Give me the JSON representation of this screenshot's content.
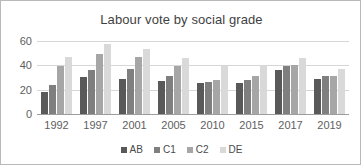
{
  "chart_data": {
    "type": "bar",
    "title": "Labour vote by social grade",
    "xlabel": "",
    "ylabel": "",
    "ylim": [
      0,
      60
    ],
    "yticks": [
      0,
      20,
      40,
      60
    ],
    "grid": true,
    "legend_position": "bottom",
    "categories": [
      "1992",
      "1997",
      "2001",
      "2005",
      "2010",
      "2015",
      "2017",
      "2019"
    ],
    "series": [
      {
        "name": "AB",
        "color": "#595959",
        "values": [
          19,
          31,
          30,
          28,
          26,
          26,
          37,
          30
        ]
      },
      {
        "name": "C1",
        "color": "#7f7f7f",
        "values": [
          25,
          37,
          38,
          32,
          27,
          29,
          40,
          32
        ]
      },
      {
        "name": "C2",
        "color": "#a6a6a6",
        "values": [
          40,
          50,
          48,
          40,
          29,
          32,
          41,
          32
        ]
      },
      {
        "name": "DE",
        "color": "#d9d9d9",
        "values": [
          48,
          58,
          54,
          47,
          40,
          41,
          47,
          38
        ]
      }
    ]
  },
  "colors": {
    "frame_border": "#b9b9b9",
    "gridline": "#d6d6d6",
    "axis": "#9d9d9d",
    "title_text": "#3f3f3f",
    "tick_text": "#5e5e5e"
  }
}
